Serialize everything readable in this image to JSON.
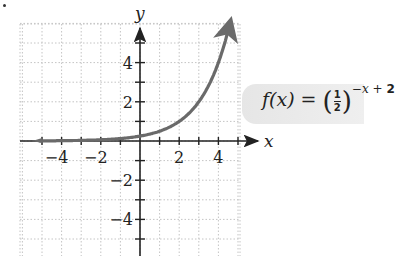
{
  "chart_data": {
    "type": "line",
    "title": "",
    "function_label": "f(x) = (1/2)^(-x + 2)",
    "formula_parts": {
      "lhs": "f(x) = ",
      "numerator": "1",
      "denominator": "2",
      "exponent_var": "−x + ",
      "exponent_const": "2"
    },
    "xlabel": "x",
    "ylabel": "y",
    "xlim": [
      -6,
      5.5
    ],
    "ylim": [
      -6,
      6
    ],
    "x_ticks": [
      -5,
      -4,
      -3,
      -2,
      -1,
      1,
      2,
      3,
      4,
      5
    ],
    "y_ticks": [
      -5,
      -4,
      -3,
      -2,
      -1,
      1,
      2,
      3,
      4,
      5
    ],
    "x_tick_labels": [
      "−4",
      "−2",
      "2",
      "4"
    ],
    "y_tick_labels": [
      "4",
      "2",
      "−2",
      "−4"
    ],
    "grid": true,
    "series": [
      {
        "name": "f(x) = (1/2)^(-x+2)",
        "x": [
          -5.5,
          -4,
          -3,
          -2,
          -1,
          0,
          1,
          2,
          3,
          4,
          4.6
        ],
        "y": [
          0.0055,
          0.0156,
          0.031,
          0.0625,
          0.125,
          0.25,
          0.5,
          1,
          2,
          4,
          6.06
        ]
      }
    ],
    "legend": "annotation box to the right of curve"
  }
}
